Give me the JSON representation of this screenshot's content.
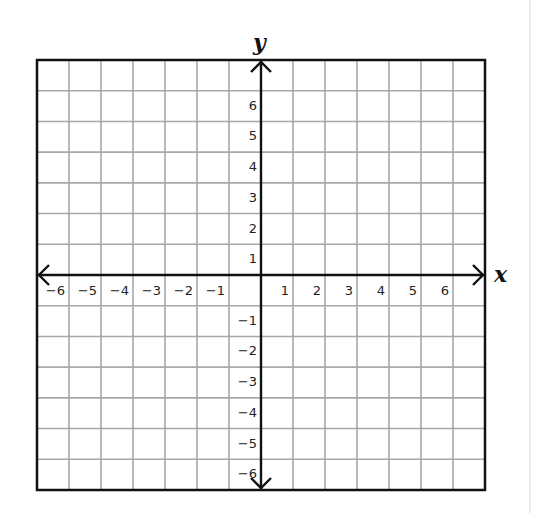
{
  "diagram": {
    "type": "coordinate-plane",
    "x_axis_label": "x",
    "y_axis_label": "y",
    "x_range": [
      -7,
      7
    ],
    "y_range": [
      -7,
      7
    ],
    "x_tick_labels": [
      "-6",
      "-5",
      "-4",
      "-3",
      "-2",
      "-1",
      "1",
      "2",
      "3",
      "4",
      "5",
      "6"
    ],
    "y_tick_labels": [
      "6",
      "5",
      "4",
      "3",
      "2",
      "1",
      "-1",
      "-2",
      "-3",
      "-4",
      "-5",
      "-6"
    ],
    "x_ticks": [
      -6,
      -5,
      -4,
      -3,
      -2,
      -1,
      1,
      2,
      3,
      4,
      5,
      6
    ],
    "y_ticks": [
      6,
      5,
      4,
      3,
      2,
      1,
      -1,
      -2,
      -3,
      -4,
      -5,
      -6
    ],
    "columns": 14,
    "rows": 14,
    "colors": {
      "grid_line": "#a8a8a8",
      "axis": "#111111",
      "border": "#111111",
      "background": "#ffffff"
    }
  }
}
